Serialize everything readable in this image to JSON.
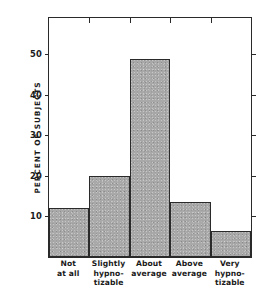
{
  "chart_data": {
    "type": "bar",
    "title": "",
    "subtitle": "",
    "xlabel": "",
    "ylabel": "PERCENT OF SUBJECTS",
    "categories": [
      "Not\nat all",
      "Slightly\nhypno-\ntizable",
      "About\naverage",
      "Above\naverage",
      "Very\nhypno-\ntizable"
    ],
    "category_lines": [
      [
        "Not",
        "at all"
      ],
      [
        "Slightly",
        "hypno-",
        "tizable"
      ],
      [
        "About",
        "average"
      ],
      [
        "Above",
        "average"
      ],
      [
        "Very",
        "hypno-",
        "tizable"
      ]
    ],
    "values": [
      12,
      20,
      49,
      13.5,
      6.5
    ],
    "ylim": [
      0,
      59
    ],
    "yticks": [
      10,
      20,
      30,
      40,
      50
    ],
    "ytick_labels": [
      "10",
      "20",
      "30",
      "40",
      "50"
    ],
    "grid": false,
    "legend": null,
    "bar_fill_color": "#a9a9a9",
    "bar_edge_color": "#2a2a2a",
    "axes_color": "#2a2a2a",
    "background_color": "#ffffff"
  }
}
